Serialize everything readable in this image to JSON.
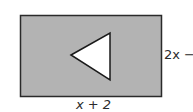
{
  "diagram": {
    "rectangle": {
      "fill": "#b3b3b3",
      "stroke": "#2a2a2a",
      "width_label": "x + 2",
      "height_label": "2x −"
    },
    "triangle": {
      "fill": "#ffffff",
      "stroke": "#1a1a1a",
      "orientation": "pointing-left"
    }
  }
}
